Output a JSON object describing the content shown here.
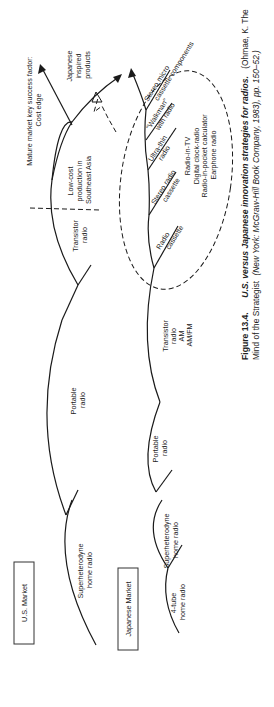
{
  "figure": {
    "number": "Figure 13.4.",
    "title": "U.S. versus Japanese innovation strategies for radios.",
    "source_line1": "(Ohmae, K. The",
    "source_line2_a": "Mind of the Strategist",
    "source_line2_b": "(New York: McGraw-Hill Book Company, 1983), pp. 150–52.)"
  },
  "us_market": {
    "box_label": "U.S. Market",
    "stages": [
      {
        "line1": "Superheterodyne",
        "line2": "home radio"
      },
      {
        "line1": "Portable",
        "line2": "radio"
      },
      {
        "line1": "Transistor",
        "line2": "radio"
      },
      {
        "line1": "Low-cost",
        "line2": "production in",
        "line3": "Southeast Asia"
      }
    ],
    "annotation_line1": "Mature market key success factor:",
    "annotation_line2": "Cost edge",
    "japanese_inspired_line1": "Japanese",
    "japanese_inspired_line2": "inspired",
    "japanese_inspired_line3": "products"
  },
  "japanese_market": {
    "box_label": "Japanese Market",
    "stages": [
      {
        "line1": "4-tube",
        "line2": "home radio"
      },
      {
        "line1": "Superheterodyne",
        "line2": "home radio"
      },
      {
        "line1": "Portable",
        "line2": "radio"
      },
      {
        "line1": "Transistor",
        "line2": "radio",
        "line3": "AM",
        "line4": "AM/FM"
      }
    ],
    "branches": [
      {
        "line1": "Radio",
        "line2": "cassette"
      },
      {
        "line1": "Stereo radio",
        "line2": "cassette"
      },
      {
        "line1": "Ultra-thin",
        "line2": "radio"
      },
      {
        "line1": "\"Walkman\"",
        "line2": "with radio"
      },
      {
        "line1": "Stereo micro",
        "line2": "cassette components"
      }
    ],
    "other_products": [
      "Radio-in-TV",
      "Digital clock-radio",
      "Radio-in-pocket calculator",
      "Earphone radio"
    ]
  }
}
